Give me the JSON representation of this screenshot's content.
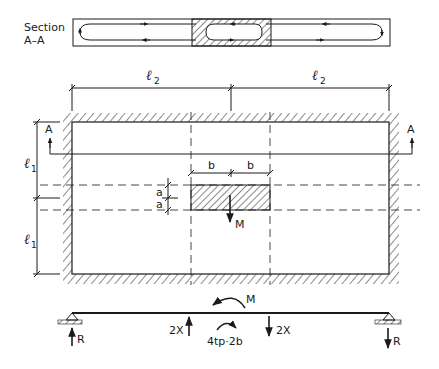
{
  "section": {
    "label_line1": "Section",
    "label_line2": "A–A"
  },
  "dimensions": {
    "l2_left": {
      "symbol": "ℓ",
      "subscript": "2"
    },
    "l2_right": {
      "symbol": "ℓ",
      "subscript": "2"
    },
    "l1_top": {
      "symbol": "ℓ",
      "subscript": "1"
    },
    "l1_bottom": {
      "symbol": "ℓ",
      "subscript": "1"
    },
    "b_left": "b",
    "b_right": "b",
    "a_top": "a",
    "a_bottom": "a"
  },
  "section_marks": {
    "left": "A",
    "right": "A"
  },
  "load": {
    "moment_label": "M"
  },
  "beam": {
    "moment_label": "M",
    "left_force": "2X",
    "right_force": "2X",
    "couple_label": "4tp·2b",
    "left_reaction": "R",
    "right_reaction": "R"
  },
  "colors": {
    "ink": "#1a1a1a",
    "background": "#ffffff"
  }
}
